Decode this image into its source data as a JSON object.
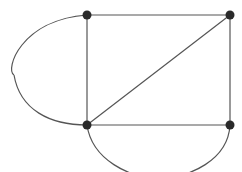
{
  "diagram": {
    "type": "graph",
    "colors": {
      "edge": "#555555",
      "node": "#2a2a2a",
      "background": "#ffffff"
    },
    "nodes": [
      {
        "id": "A",
        "x": 87,
        "y": 15
      },
      {
        "id": "B",
        "x": 230,
        "y": 15
      },
      {
        "id": "C",
        "x": 87,
        "y": 125
      },
      {
        "id": "D",
        "x": 230,
        "y": 125
      }
    ],
    "edges": [
      {
        "from": "A",
        "to": "B",
        "kind": "straight"
      },
      {
        "from": "A",
        "to": "C",
        "kind": "straight"
      },
      {
        "from": "C",
        "to": "B",
        "kind": "straight"
      },
      {
        "from": "C",
        "to": "D",
        "kind": "straight"
      },
      {
        "from": "B",
        "to": "D",
        "kind": "straight"
      },
      {
        "from": "A",
        "to": "C",
        "kind": "arc-left"
      },
      {
        "from": "C",
        "to": "D",
        "kind": "arc-bottom"
      }
    ]
  }
}
